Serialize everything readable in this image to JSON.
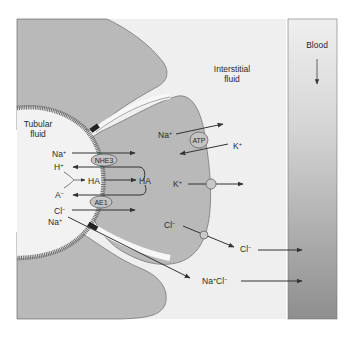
{
  "regions": {
    "tubular_fluid_line1": "Tubular",
    "tubular_fluid_line2": "fluid",
    "interstitial_line1": "Interstitial",
    "interstitial_line2": "fluid",
    "blood": "Blood"
  },
  "transporters": {
    "nhe3": "NHE3",
    "ae1": "AE1",
    "atp": "ATP"
  },
  "ions": {
    "na_apical": "Na",
    "na_apical_sup": "+",
    "h": "H",
    "h_sup": "+",
    "ha_left": "HA",
    "ha_right": "HA",
    "a": "A",
    "a_sup": "−",
    "cl_apical": "Cl",
    "cl_apical_sup": "−",
    "na_para": "Na",
    "na_para_sup": "+",
    "na_pump": "Na",
    "na_pump_sup": "+",
    "k_pump": "K",
    "k_pump_sup": "+",
    "k_channel": "K",
    "k_channel_sup": "+",
    "cl_basal_in": "Cl",
    "cl_basal_in_sup": "−",
    "cl_basal_out": "Cl",
    "cl_basal_out_sup": "−",
    "nacl_na": "Na",
    "nacl_na_sup": "+",
    "nacl_cl": "Cl",
    "nacl_cl_sup": "−"
  },
  "colors": {
    "cell": "#b9b9b9",
    "cell_stroke": "#6a6a6a",
    "frame_bg": "#efefef",
    "membrane": "#6e6e6e",
    "arrow": "#333333",
    "blood_top": "#ececec",
    "blood_bottom": "#8f8f8f"
  }
}
